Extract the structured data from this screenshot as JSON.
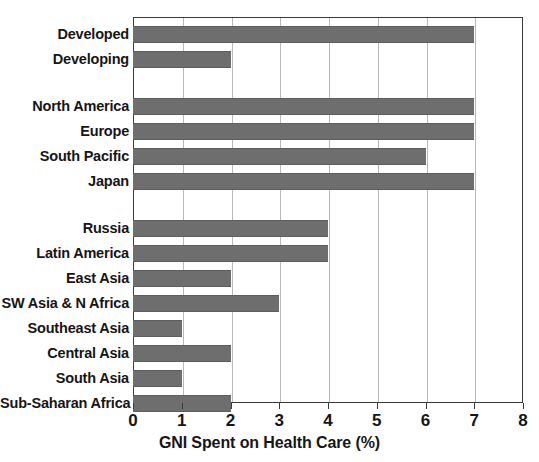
{
  "chart_data": {
    "type": "bar",
    "orientation": "horizontal",
    "title": "",
    "xlabel": "GNI Spent on Health Care (%)",
    "ylabel": "",
    "xlim": [
      0,
      8
    ],
    "xticks": [
      0,
      1,
      2,
      3,
      4,
      5,
      6,
      7,
      8
    ],
    "xtick_labels": [
      "0",
      "1",
      "2",
      "3",
      "4",
      "5",
      "6",
      "7",
      "8"
    ],
    "grid": true,
    "grid_axis": "x",
    "legend": false,
    "bar_color": "#6e6e6e",
    "categories": [
      "Developed",
      "Developing",
      "North America",
      "Europe",
      "South Pacific",
      "Japan",
      "Russia",
      "Latin America",
      "East Asia",
      "SW Asia & N Africa",
      "Southeast Asia",
      "Central Asia",
      "South Asia",
      "Sub-Saharan Africa"
    ],
    "values": [
      7,
      2,
      7,
      7,
      6,
      7,
      4,
      4,
      2,
      3,
      1,
      2,
      1,
      2
    ],
    "groups": [
      {
        "name": "",
        "categories": [
          "Developed",
          "Developing"
        ],
        "values": [
          7,
          2
        ]
      },
      {
        "name": "",
        "categories": [
          "North America",
          "Europe",
          "South Pacific",
          "Japan"
        ],
        "values": [
          7,
          7,
          6,
          7
        ]
      },
      {
        "name": "",
        "categories": [
          "Russia",
          "Latin America",
          "East Asia",
          "SW Asia & N Africa",
          "Southeast Asia",
          "Central Asia",
          "South Asia",
          "Sub-Saharan Africa"
        ],
        "values": [
          4,
          4,
          2,
          3,
          1,
          2,
          1,
          2
        ]
      }
    ]
  }
}
